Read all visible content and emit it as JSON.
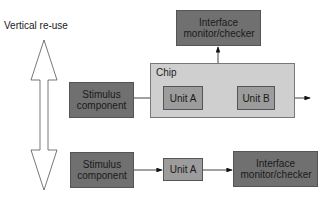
{
  "diagram": {
    "side_label": "Vertical re-use",
    "top_row": {
      "stimulus": "Stimulus component",
      "chip_label": "Chip",
      "unit_a": "Unit A",
      "unit_b": "Unit B",
      "monitor": "Interface monitor/checker"
    },
    "bottom_row": {
      "stimulus": "Stimulus component",
      "unit_a": "Unit A",
      "monitor": "Interface monitor/checker"
    },
    "colors": {
      "dark_box": "#707070",
      "unit_box": "#9c9c9c",
      "chip_bg": "#cfcfcf"
    }
  }
}
